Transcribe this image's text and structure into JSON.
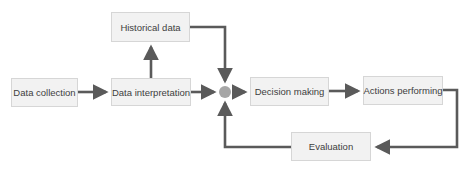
{
  "diagram": {
    "type": "flowchart",
    "colors": {
      "arrow": "#5a5a5a",
      "node_fill": "#f2f2f2",
      "node_border": "#d6d6d6",
      "junction": "#a6a6a6",
      "text": "#404040"
    },
    "nodes": [
      {
        "id": "data-collection",
        "label": "Data collection"
      },
      {
        "id": "data-interpretation",
        "label": "Data interpretation"
      },
      {
        "id": "historical-data",
        "label": "Historical data"
      },
      {
        "id": "decision-making",
        "label": "Decision making"
      },
      {
        "id": "actions-performing",
        "label": "Actions performing"
      },
      {
        "id": "evaluation",
        "label": "Evaluation"
      }
    ],
    "edges": [
      {
        "from": "data-collection",
        "to": "data-interpretation"
      },
      {
        "from": "data-interpretation",
        "to": "historical-data"
      },
      {
        "from": "data-interpretation",
        "to": "junction"
      },
      {
        "from": "historical-data",
        "to": "junction"
      },
      {
        "from": "evaluation",
        "to": "junction"
      },
      {
        "from": "junction",
        "to": "decision-making"
      },
      {
        "from": "decision-making",
        "to": "actions-performing"
      },
      {
        "from": "actions-performing",
        "to": "evaluation"
      }
    ]
  }
}
